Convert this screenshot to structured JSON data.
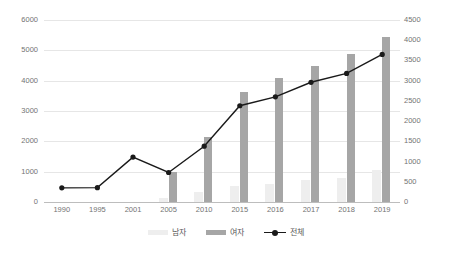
{
  "chart_data": {
    "type": "bar",
    "title": "",
    "subtitle": "",
    "xlabel": "",
    "ylabel": "",
    "categories": [
      "1990",
      "1995",
      "2001",
      "2005",
      "2010",
      "2015",
      "2016",
      "2017",
      "2018",
      "2019"
    ],
    "grid": true,
    "legend_position": "bottom",
    "axes": {
      "left": {
        "label": "",
        "min": 0,
        "max": 6000,
        "step": 1000,
        "ticks": [
          "0",
          "1000",
          "2000",
          "3000",
          "4000",
          "5000",
          "6000"
        ],
        "applies_to": [
          "남자",
          "여자"
        ]
      },
      "right": {
        "label": "",
        "min": 0,
        "max": 4500,
        "step": 500,
        "ticks": [
          "0",
          "500",
          "1000",
          "1500",
          "2000",
          "2500",
          "3000",
          "3500",
          "4000",
          "4500"
        ],
        "applies_to": [
          "전체"
        ]
      }
    },
    "series": [
      {
        "name": "남자",
        "type": "bar",
        "axis": "left",
        "color": "#eeeeee",
        "values": [
          0,
          0,
          0,
          130,
          330,
          540,
          580,
          720,
          800,
          1040
        ]
      },
      {
        "name": "여자",
        "type": "bar",
        "axis": "left",
        "color": "#a6a6a6",
        "values": [
          0,
          0,
          0,
          980,
          2140,
          3640,
          4080,
          4490,
          4890,
          5440
        ]
      },
      {
        "name": "전체",
        "type": "line",
        "axis": "right",
        "color": "#1a1a1a",
        "values": [
          350,
          355,
          1110,
          730,
          1380,
          2380,
          2600,
          2960,
          3180,
          3650
        ]
      }
    ]
  },
  "legend": {
    "items": [
      {
        "label": "남자",
        "marker": "bar-swatch-light"
      },
      {
        "label": "여자",
        "marker": "bar-swatch-dark"
      },
      {
        "label": "전체",
        "marker": "line-with-dot"
      }
    ]
  }
}
